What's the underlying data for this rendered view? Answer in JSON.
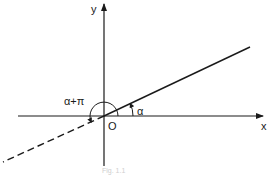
{
  "figure": {
    "axes": {
      "x_label": "x",
      "y_label": "y",
      "origin_label": "O"
    },
    "angles": {
      "alpha_label": "α",
      "alpha_plus_pi_label": "α+π"
    },
    "lines": {
      "solid_ray": "ray at angle α from origin",
      "dashed_ray": "extension at angle α+π"
    },
    "caption": "Fig. 1.1",
    "colors": {
      "ink": "#1a1a1a",
      "background": "#ffffff"
    }
  }
}
